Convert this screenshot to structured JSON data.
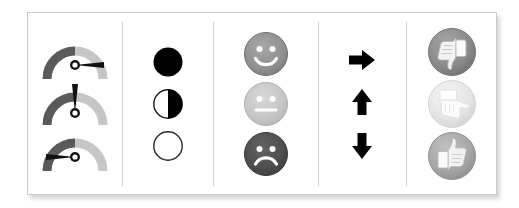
{
  "panel": {
    "title": "icon-set-reference-panel",
    "background_color": "#ffffff",
    "border_color": "#c9c9c9"
  },
  "palette": {
    "black": "#000000",
    "dark_gray": "#595959",
    "mid_gray": "#8c8c8c",
    "light_gray": "#bfbfbf",
    "pale_gray": "#e6e6e6",
    "divider": "#cfcfcf"
  },
  "columns": [
    {
      "name": "gauges",
      "label": "3 Gauges",
      "items": [
        {
          "name": "gauge-needle-right",
          "label": "Gauge needle right",
          "needle_angle_deg": 90,
          "left_arc_color": "#5a5a5a",
          "right_arc_color": "#c6c6c6"
        },
        {
          "name": "gauge-needle-up",
          "label": "Gauge needle up",
          "needle_angle_deg": 0,
          "left_arc_color": "#5a5a5a",
          "right_arc_color": "#c6c6c6"
        },
        {
          "name": "gauge-needle-left",
          "label": "Gauge needle left",
          "needle_angle_deg": -90,
          "left_arc_color": "#5a5a5a",
          "right_arc_color": "#c6c6c6"
        }
      ]
    },
    {
      "name": "circles",
      "label": "3 Circles (fill levels)",
      "items": [
        {
          "name": "circle-full",
          "label": "Full circle",
          "fill_fraction": 1,
          "fill_color": "#000000"
        },
        {
          "name": "circle-half",
          "label": "Half circle",
          "fill_fraction": 0.5,
          "fill_color": "#000000"
        },
        {
          "name": "circle-empty",
          "label": "Empty circle",
          "fill_fraction": 0,
          "fill_color": "#ffffff"
        }
      ]
    },
    {
      "name": "faces",
      "label": "3 Symbols (smiley faces)",
      "items": [
        {
          "name": "face-happy",
          "label": "Happy face",
          "face_color": "#8f8f8f",
          "mouth": "smile"
        },
        {
          "name": "face-neutral",
          "label": "Neutral face",
          "face_color": "#c5c5c5",
          "mouth": "flat"
        },
        {
          "name": "face-sad",
          "label": "Sad face",
          "face_color": "#4d4d4d",
          "mouth": "frown"
        }
      ]
    },
    {
      "name": "arrows",
      "label": "3 Arrows",
      "items": [
        {
          "name": "arrow-right",
          "label": "Right arrow",
          "direction": "right",
          "color": "#000000"
        },
        {
          "name": "arrow-up",
          "label": "Up arrow",
          "direction": "up",
          "color": "#000000"
        },
        {
          "name": "arrow-down",
          "label": "Down arrow",
          "direction": "down",
          "color": "#000000"
        }
      ]
    },
    {
      "name": "thumbs",
      "label": "3 Thumbs",
      "items": [
        {
          "name": "thumb-down",
          "label": "Thumbs down",
          "orientation": "down",
          "disc_color": "#8a8a8a"
        },
        {
          "name": "thumb-side",
          "label": "Thumb sideways",
          "orientation": "side",
          "disc_color": "#e4e4e4"
        },
        {
          "name": "thumb-up",
          "label": "Thumbs up",
          "orientation": "up",
          "disc_color": "#a6a6a6"
        }
      ]
    }
  ]
}
